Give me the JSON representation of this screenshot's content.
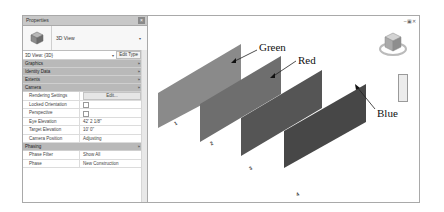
{
  "properties": {
    "title": "Properties",
    "close_icon": "×",
    "type_selector": {
      "name": "3D View",
      "arrow": "▾"
    },
    "instance": {
      "label": "3D View: {3D}",
      "dropdown": "▾",
      "edit_type": "Edit Type"
    },
    "groups": [
      {
        "label": "Graphics",
        "chevron": "»"
      },
      {
        "label": "Identity Data",
        "chevron": "»"
      },
      {
        "label": "Extents",
        "chevron": "»"
      },
      {
        "label": "Camera",
        "chevron": "»"
      }
    ],
    "camera_rows": [
      {
        "key": "Rendering Settings",
        "value": "Edit..."
      },
      {
        "key": "Locked Orientation",
        "value": ""
      },
      {
        "key": "Perspective",
        "value": ""
      },
      {
        "key": "Eye Elevation",
        "value": "42'  2 1/8\""
      },
      {
        "key": "Target Elevation",
        "value": "10'  0\""
      },
      {
        "key": "Camera Position",
        "value": "Adjusting"
      }
    ],
    "phasing_group": {
      "label": "Phasing",
      "chevron": "»"
    },
    "phasing_rows": [
      {
        "key": "Phase Filter",
        "value": "Show All"
      },
      {
        "key": "Phase",
        "value": "New Construction"
      }
    ]
  },
  "viewport": {
    "window_controls": "–▣✕",
    "panels": [
      {
        "label": "Green",
        "color": "#8a8a8a",
        "number": "1"
      },
      {
        "label": "Red",
        "color": "#6e6e6e",
        "number": "2"
      },
      {
        "label": "",
        "color": "#555555",
        "number": "3"
      },
      {
        "label": "Blue",
        "color": "#474747",
        "number": "4"
      }
    ]
  }
}
